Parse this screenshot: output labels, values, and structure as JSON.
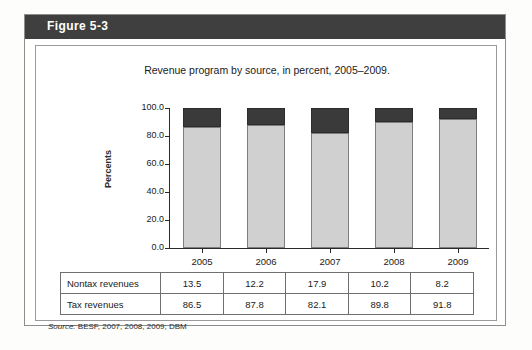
{
  "figure": {
    "label": "Figure 5-3",
    "source_prefix": "Source:",
    "source_text": "BESF, 2007, 2008, 2009; DBM"
  },
  "chart_data": {
    "type": "bar",
    "stacked": true,
    "title": "Revenue program by source, in percent, 2005–2009.",
    "xlabel": "",
    "ylabel": "Percents",
    "categories": [
      "2005",
      "2006",
      "2007",
      "2008",
      "2009"
    ],
    "ylim": [
      0,
      100
    ],
    "yticks": [
      "0.0",
      "20.0",
      "40.0",
      "60.0",
      "80.0",
      "100.0"
    ],
    "grid": false,
    "legend": "none",
    "series": [
      {
        "name": "Tax revenues",
        "color": "#d0d0d0",
        "values": [
          86.5,
          87.8,
          82.1,
          89.8,
          91.8
        ]
      },
      {
        "name": "Nontax revenues",
        "color": "#3a3a3a",
        "values": [
          13.5,
          12.2,
          17.9,
          10.2,
          8.2
        ]
      }
    ]
  },
  "table": {
    "rows": [
      {
        "label": "Nontax revenues",
        "values": [
          "13.5",
          "12.2",
          "17.9",
          "10.2",
          "8.2"
        ]
      },
      {
        "label": "Tax revenues",
        "values": [
          "86.5",
          "87.8",
          "82.1",
          "89.8",
          "91.8"
        ]
      }
    ]
  }
}
